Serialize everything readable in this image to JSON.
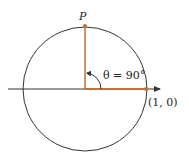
{
  "diagram": {
    "point_label": "P",
    "angle_label": "θ = 90°",
    "point_coord_label": "(1, 0)",
    "colors": {
      "accent": "#c0703a",
      "line": "#333333"
    }
  }
}
